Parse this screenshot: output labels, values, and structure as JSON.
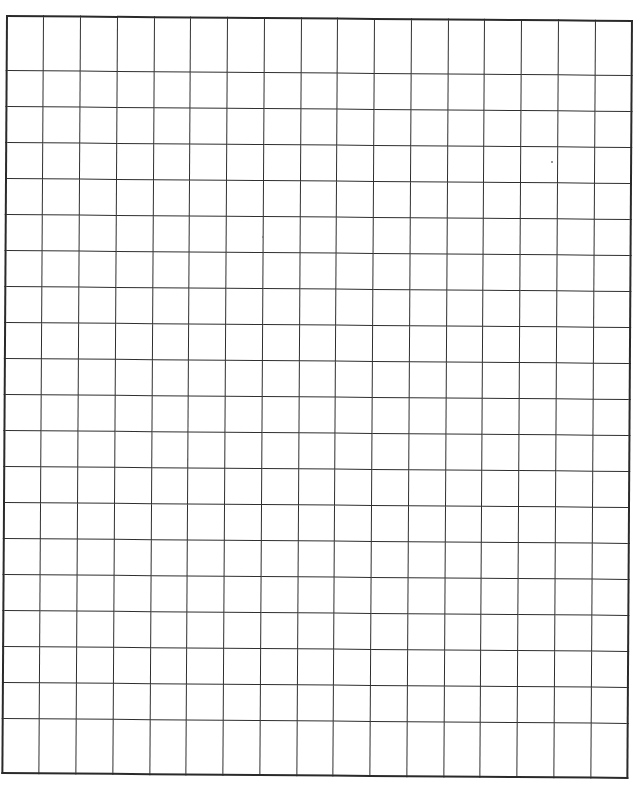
{
  "page": {
    "type": "graph-paper worksheet",
    "background_color": "#ffffff",
    "line_color": "#2f2f2f"
  },
  "grid": {
    "columns": 17,
    "rows": 20,
    "cell_width_px": 36.8,
    "cell_height_px": 38
  }
}
